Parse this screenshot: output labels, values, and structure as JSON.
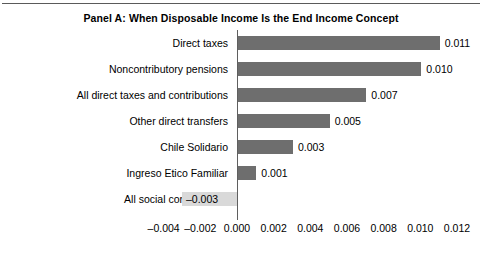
{
  "chart_data": {
    "type": "bar",
    "orientation": "horizontal",
    "title": "Panel A:  When Disposable Income Is the End Income Concept",
    "xlabel": "",
    "ylabel": "",
    "xlim": [
      -0.004,
      0.012
    ],
    "xticks": [
      "–0.004",
      "–0.002",
      "0.000",
      "0.002",
      "0.004",
      "0.006",
      "0.008",
      "0.010",
      "0.012"
    ],
    "xtick_values": [
      -0.004,
      -0.002,
      0.0,
      0.002,
      0.004,
      0.006,
      0.008,
      0.01,
      0.012
    ],
    "grid": false,
    "legend": "none",
    "categories": [
      "Direct taxes",
      "Noncontributory pensions",
      "All direct taxes and contributions",
      "Other direct transfers",
      "Chile Solidario",
      "Ingreso Etico Familiar",
      "All social contributions"
    ],
    "values": [
      0.011,
      0.01,
      0.007,
      0.005,
      0.003,
      0.001,
      -0.003
    ],
    "value_labels": [
      "0.011",
      "0.010",
      "0.007",
      "0.005",
      "0.003",
      "0.001",
      "–0.003"
    ],
    "colors": {
      "positive_bar": "#6e6e6e",
      "negative_bar": "#d9d9d9",
      "axis": "#5f5f5f",
      "text": "#000000",
      "background": "#ffffff"
    }
  }
}
